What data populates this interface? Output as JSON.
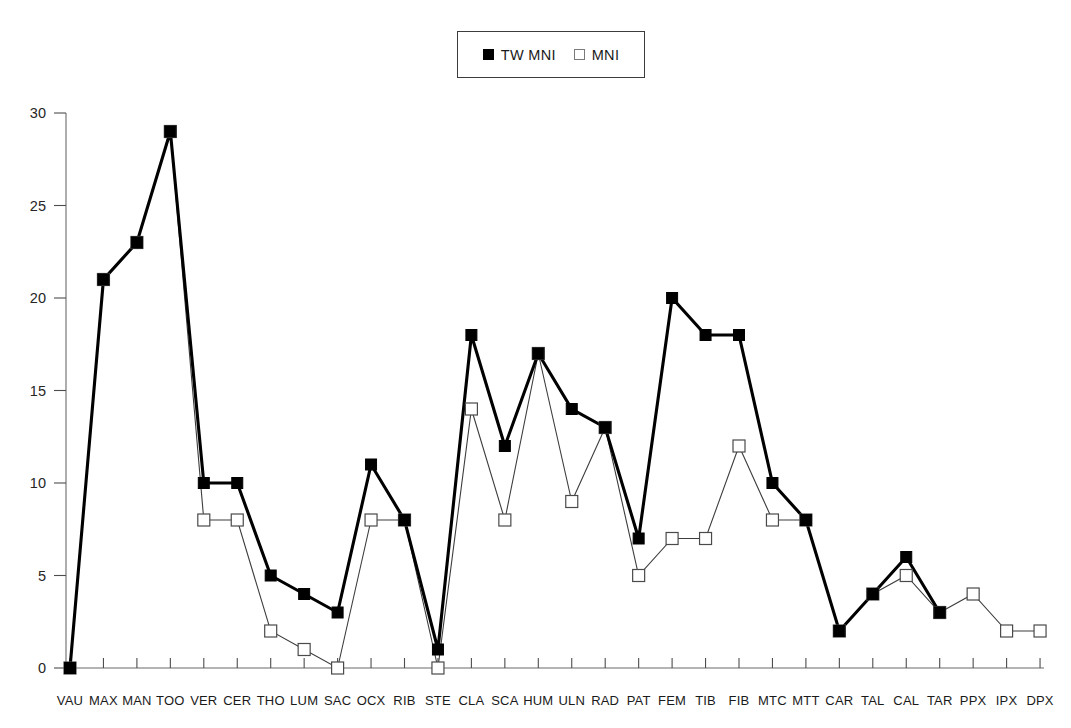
{
  "chart_data": {
    "type": "line",
    "title": "",
    "xlabel": "",
    "ylabel": "",
    "ylim": [
      0,
      30
    ],
    "yticks": [
      0,
      5,
      10,
      15,
      20,
      25,
      30
    ],
    "grid": false,
    "legend_position": "top-center",
    "categories": [
      "VAU",
      "MAX",
      "MAN",
      "TOO",
      "VER",
      "CER",
      "THO",
      "LUM",
      "SAC",
      "OCX",
      "RIB",
      "STE",
      "CLA",
      "SCA",
      "HUM",
      "ULN",
      "RAD",
      "PAT",
      "FEM",
      "TIB",
      "FIB",
      "MTC",
      "MTT",
      "CAR",
      "TAL",
      "CAL",
      "TAR",
      "PPX",
      "IPX",
      "DPX"
    ],
    "series": [
      {
        "name": "TW MNI",
        "marker": "filled-square",
        "values": [
          0,
          21,
          23,
          29,
          10,
          10,
          5,
          4,
          3,
          11,
          8,
          1,
          18,
          12,
          17,
          14,
          13,
          7,
          20,
          18,
          18,
          10,
          8,
          2,
          4,
          6,
          3,
          null,
          null,
          null
        ]
      },
      {
        "name": "MNI",
        "marker": "open-square",
        "values": [
          0,
          21,
          23,
          29,
          8,
          8,
          2,
          1,
          0,
          8,
          8,
          0,
          14,
          8,
          17,
          9,
          13,
          5,
          7,
          7,
          12,
          8,
          8,
          2,
          4,
          5,
          3,
          4,
          2,
          2
        ]
      }
    ]
  },
  "legend": {
    "entries": [
      {
        "label": "TW MNI",
        "marker": "filled-square-icon"
      },
      {
        "label": "MNI",
        "marker": "open-square-icon"
      }
    ]
  },
  "colors": {
    "tw_series": "#000000",
    "mni_series": "#3d3d3d",
    "axis": "#6b6b6b",
    "background": "#ffffff"
  }
}
